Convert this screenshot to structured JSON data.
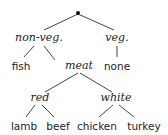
{
  "diagram": {
    "type": "tree",
    "colors": {
      "line": "#444444",
      "text": "#222222",
      "root_dot": "#111111"
    },
    "root": {
      "label": "",
      "marker": "dot"
    },
    "nodes": {
      "nonveg": "non-veg.",
      "veg": "veg.",
      "fish": "fish",
      "meat": "meat",
      "none": "none",
      "red": "red",
      "white": "white",
      "lamb": "lamb",
      "beef": "beef",
      "chicken": "chicken",
      "turkey": "turkey"
    },
    "edges": [
      [
        "root",
        "non-veg."
      ],
      [
        "root",
        "veg."
      ],
      [
        "non-veg.",
        "fish"
      ],
      [
        "non-veg.",
        "meat"
      ],
      [
        "veg.",
        "none"
      ],
      [
        "meat",
        "red"
      ],
      [
        "meat",
        "white"
      ],
      [
        "red",
        "lamb"
      ],
      [
        "red",
        "beef"
      ],
      [
        "white",
        "chicken"
      ],
      [
        "white",
        "turkey"
      ]
    ]
  }
}
